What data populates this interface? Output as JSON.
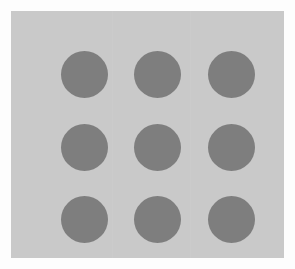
{
  "image": {
    "kind": "dot-grid-pattern",
    "width": 295,
    "height": 269,
    "background_color": "#fdfdfd",
    "alt_text": "Gray square panel containing a three by three grid of nine darker gray circles"
  },
  "panel": {
    "name": "dot-grid-panel",
    "fill_color": "#c9c9c9",
    "x": 11,
    "y": 11,
    "width": 273,
    "height": 247
  },
  "grid": {
    "rows": 3,
    "columns": 3,
    "count": 9,
    "dot_color": "#7e7e7e",
    "dot_diameter": 47,
    "column_centers": [
      73.5,
      146,
      220
    ],
    "row_centers": [
      63.5,
      136.5,
      208.5
    ],
    "dots": [
      {
        "id": "dot-r1-c1",
        "row": 1,
        "column": 1,
        "cx": 73.5,
        "cy": 63.5,
        "r": 23.5
      },
      {
        "id": "dot-r1-c2",
        "row": 1,
        "column": 2,
        "cx": 146,
        "cy": 63.5,
        "r": 23.5
      },
      {
        "id": "dot-r1-c3",
        "row": 1,
        "column": 3,
        "cx": 220,
        "cy": 63.5,
        "r": 23.5
      },
      {
        "id": "dot-r2-c1",
        "row": 2,
        "column": 1,
        "cx": 73.5,
        "cy": 136.5,
        "r": 23.5
      },
      {
        "id": "dot-r2-c2",
        "row": 2,
        "column": 2,
        "cx": 146,
        "cy": 136.5,
        "r": 23.5
      },
      {
        "id": "dot-r2-c3",
        "row": 2,
        "column": 3,
        "cx": 220,
        "cy": 136.5,
        "r": 23.5
      },
      {
        "id": "dot-r3-c1",
        "row": 3,
        "column": 1,
        "cx": 73.5,
        "cy": 208.5,
        "r": 23.5
      },
      {
        "id": "dot-r3-c2",
        "row": 3,
        "column": 2,
        "cx": 146,
        "cy": 208.5,
        "r": 23.5
      },
      {
        "id": "dot-r3-c3",
        "row": 3,
        "column": 3,
        "cx": 220,
        "cy": 208.5,
        "r": 23.5
      }
    ]
  },
  "seams": {
    "x_positions": [
      112,
      190
    ]
  }
}
